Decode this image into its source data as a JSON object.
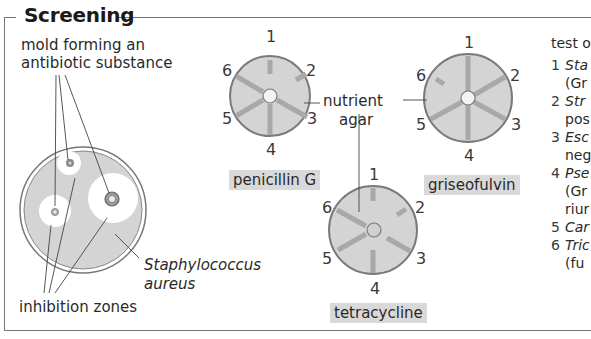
{
  "title": "Screening",
  "left_panel": {
    "mold_label_line1": "mold forming an",
    "mold_label_line2": "antibiotic substance",
    "inhibition_label": "inhibition zones",
    "bacteria_label_line1": "Staphylococcus",
    "bacteria_label_line2": "aureus"
  },
  "center_panel": {
    "nutrient_label_line1": "nutrient",
    "nutrient_label_line2": "agar",
    "discs": [
      {
        "name": "penicillin G",
        "numbers": [
          "1",
          "2",
          "3",
          "4",
          "5",
          "6"
        ]
      },
      {
        "name": "griseofulvin",
        "numbers": [
          "1",
          "2",
          "3",
          "4",
          "5",
          "6"
        ]
      },
      {
        "name": "tetracycline",
        "numbers": [
          "1",
          "2",
          "3",
          "4",
          "5",
          "6"
        ]
      }
    ]
  },
  "legend": {
    "heading": "test o",
    "items": [
      {
        "num": "1",
        "line1": "Sta",
        "line2": "(Gr"
      },
      {
        "num": "2",
        "line1": "Str",
        "line2": "pos"
      },
      {
        "num": "3",
        "line1": "Esc",
        "line2": "neg"
      },
      {
        "num": "4",
        "line1": "Pse",
        "line2": "(Gr",
        "line3": "riur"
      },
      {
        "num": "5",
        "line1": "Car"
      },
      {
        "num": "6",
        "line1": "Tric",
        "line2": "(fu"
      }
    ]
  },
  "colors": {
    "agar": "#d4d4d4",
    "rim": "#7a7a7a",
    "streak": "#a8a8a8",
    "zone": "#ffffff",
    "tag_bg": "#d9d9d9"
  }
}
